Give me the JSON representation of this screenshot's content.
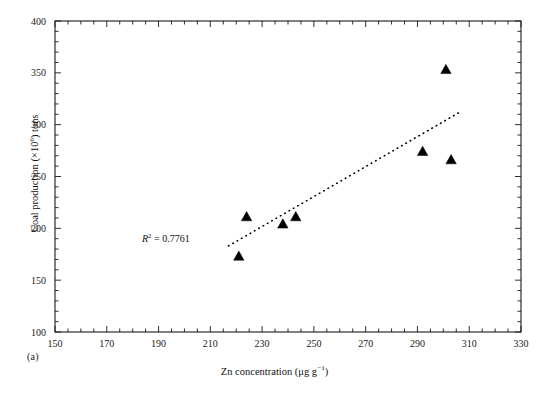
{
  "figure": {
    "panel_label": "(a)",
    "annotation": "R2 = 0.7761",
    "annotation_symbol": "R",
    "annotation_exponent": "2",
    "annotation_value": "= 0.7761"
  },
  "axes": {
    "x": {
      "title_main": "Zn concentration (",
      "title_unit": "μg g",
      "title_unit_exp": "−1",
      "title_close": ")",
      "min": 150,
      "max": 330,
      "major_step": 20,
      "minor_step": 5,
      "ticks": [
        150,
        170,
        190,
        210,
        230,
        250,
        270,
        290,
        310,
        330
      ],
      "tick_labels": [
        "150",
        "170",
        "190",
        "210",
        "230",
        "250",
        "270",
        "290",
        "310",
        "330"
      ]
    },
    "y": {
      "title_main": "Coal production (×10",
      "title_exp": "6",
      "title_close": ") tons",
      "min": 100,
      "max": 400,
      "major_step": 50,
      "minor_step": 10,
      "ticks": [
        100,
        150,
        200,
        250,
        300,
        350,
        400
      ],
      "tick_labels": [
        "100",
        "150",
        "200",
        "250",
        "300",
        "350",
        "400"
      ]
    }
  },
  "chart_data": {
    "type": "scatter",
    "title": "",
    "xlabel": "Zn concentration (μg g⁻¹)",
    "ylabel": "Coal production (×10⁶) tons",
    "xlim": [
      150,
      330
    ],
    "ylim": [
      100,
      400
    ],
    "grid": false,
    "legend": null,
    "marker": "triangle-up-filled",
    "marker_color": "#000000",
    "series": [
      {
        "name": "Coal production vs Zn concentration",
        "points": [
          {
            "x": 221,
            "y": 173
          },
          {
            "x": 224,
            "y": 211
          },
          {
            "x": 238,
            "y": 204
          },
          {
            "x": 243,
            "y": 211
          },
          {
            "x": 292,
            "y": 274
          },
          {
            "x": 301,
            "y": 353
          },
          {
            "x": 303,
            "y": 266
          }
        ]
      }
    ],
    "trendline": {
      "style": "dotted",
      "color": "#000000",
      "r_squared": 0.7761,
      "x_start": 217,
      "y_start": 183,
      "x_end": 307,
      "y_end": 313
    },
    "annotations": [
      {
        "text": "R2 = 0.7761",
        "x": 205,
        "y": 230
      }
    ]
  }
}
